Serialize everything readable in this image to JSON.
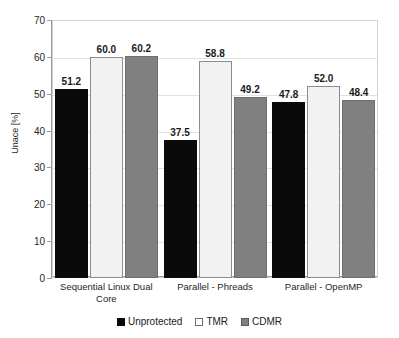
{
  "chart_data": {
    "type": "bar",
    "title": "",
    "xlabel": "",
    "ylabel": "Unace [%]",
    "ylim": [
      0,
      70
    ],
    "ytick_step": 10,
    "yticks": [
      70,
      60,
      50,
      40,
      30,
      20,
      10,
      0
    ],
    "grid": true,
    "legend_position": "bottom",
    "categories": [
      "Sequential Linux Dual Core",
      "Parallel - Phreads",
      "Parallel - OpenMP"
    ],
    "series": [
      {
        "name": "Unprotected",
        "color": "#0a0a0a",
        "values": [
          51.2,
          37.5,
          47.8
        ]
      },
      {
        "name": "TMR",
        "color": "#f2f2f2",
        "values": [
          60.0,
          58.8,
          52.0
        ]
      },
      {
        "name": "CDMR",
        "color": "#808080",
        "values": [
          60.2,
          49.2,
          48.4
        ]
      }
    ],
    "data_labels": [
      [
        "51.2",
        "60.0",
        "60.2"
      ],
      [
        "37.5",
        "58.8",
        "49.2"
      ],
      [
        "47.8",
        "52.0",
        "48.4"
      ]
    ]
  },
  "legend": {
    "items": [
      {
        "label": "Unprotected",
        "swatch": "black-square-icon"
      },
      {
        "label": "TMR",
        "swatch": "white-square-icon"
      },
      {
        "label": "CDMR",
        "swatch": "gray-square-icon"
      }
    ]
  }
}
